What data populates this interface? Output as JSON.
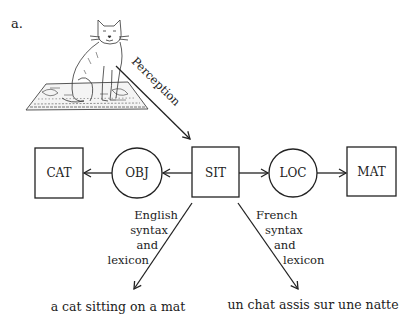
{
  "panel_label": "a.",
  "illustration": {
    "name": "cat-sitting-on-mat",
    "description": "Line drawing of a cat sitting on a patterned mat"
  },
  "perception_arrow": {
    "label": "Perception"
  },
  "nodes": {
    "cat": {
      "label": "CAT",
      "shape": "square"
    },
    "obj": {
      "label": "OBJ",
      "shape": "circle"
    },
    "sit": {
      "label": "SIT",
      "shape": "square"
    },
    "loc": {
      "label": "LOC",
      "shape": "circle"
    },
    "mat": {
      "label": "MAT",
      "shape": "square"
    }
  },
  "edges": [
    {
      "from": "SIT",
      "to": "OBJ"
    },
    {
      "from": "OBJ",
      "to": "CAT"
    },
    {
      "from": "SIT",
      "to": "LOC"
    },
    {
      "from": "LOC",
      "to": "MAT"
    }
  ],
  "branches": {
    "english": {
      "lines": [
        "English",
        "syntax",
        "and",
        "lexicon"
      ],
      "output": "a cat sitting on a mat"
    },
    "french": {
      "lines": [
        "French",
        "syntax",
        "and",
        "lexicon"
      ],
      "output": "un chat assis sur une natte"
    }
  },
  "colors": {
    "ink": "#222222",
    "background": "#ffffff"
  }
}
